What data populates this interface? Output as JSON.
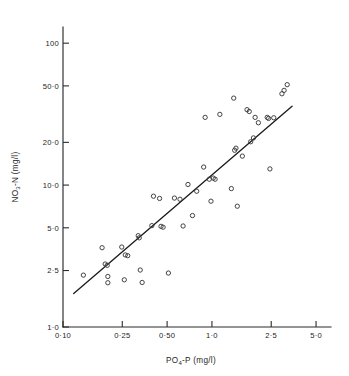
{
  "chart_data": {
    "type": "scatter",
    "title": "",
    "subtitle": "",
    "xlabel": "PO4-P (mg/l)",
    "ylabel": "NO3-N (mg/l)",
    "xlabel_parts": {
      "lead": "PO",
      "sub": "4",
      "tail": "-P (mg/l)"
    },
    "ylabel_parts": {
      "lead": "NO",
      "sub": "3",
      "tail": "-N (mg/l)"
    },
    "xscale": "log",
    "yscale": "log",
    "xlim": [
      0.1,
      6.3
    ],
    "ylim": [
      1.0,
      130
    ],
    "grid": false,
    "legend": null,
    "legend_position": "none",
    "marker_style": "open-circle",
    "xticks": [
      {
        "value": 0.1,
        "label": "0·10"
      },
      {
        "value": 0.25,
        "label": "0·25"
      },
      {
        "value": 0.5,
        "label": "0·50"
      },
      {
        "value": 1.0,
        "label": "1·0"
      },
      {
        "value": 2.5,
        "label": "2·5"
      },
      {
        "value": 5.0,
        "label": "5·0"
      }
    ],
    "yticks": [
      {
        "value": 1.0,
        "label": "1·0"
      },
      {
        "value": 2.5,
        "label": "2·5"
      },
      {
        "value": 5.0,
        "label": "5·0"
      },
      {
        "value": 10.0,
        "label": "10·0"
      },
      {
        "value": 20.0,
        "label": "20·0"
      },
      {
        "value": 50.0,
        "label": "50·0"
      },
      {
        "value": 100.0,
        "label": "100"
      }
    ],
    "series": [
      {
        "name": "samples",
        "marker": "open-circle",
        "points": [
          [
            0.137,
            2.32
          ],
          [
            0.183,
            3.62
          ],
          [
            0.192,
            2.78
          ],
          [
            0.198,
            2.72
          ],
          [
            0.2,
            2.27
          ],
          [
            0.2,
            2.05
          ],
          [
            0.248,
            3.66
          ],
          [
            0.258,
            2.15
          ],
          [
            0.262,
            3.22
          ],
          [
            0.272,
            3.18
          ],
          [
            0.32,
            4.4
          ],
          [
            0.325,
            4.25
          ],
          [
            0.33,
            2.52
          ],
          [
            0.34,
            2.06
          ],
          [
            0.395,
            5.18
          ],
          [
            0.405,
            8.35
          ],
          [
            0.445,
            8.05
          ],
          [
            0.455,
            5.12
          ],
          [
            0.47,
            5.05
          ],
          [
            0.51,
            2.4
          ],
          [
            0.56,
            8.1
          ],
          [
            0.61,
            7.95
          ],
          [
            0.64,
            5.15
          ],
          [
            0.69,
            10.1
          ],
          [
            0.74,
            6.1
          ],
          [
            0.79,
            9.05
          ],
          [
            0.88,
            13.4
          ],
          [
            0.9,
            30.0
          ],
          [
            0.96,
            11.0
          ],
          [
            0.985,
            7.7
          ],
          [
            1.02,
            11.2
          ],
          [
            1.05,
            11.0
          ],
          [
            1.13,
            31.5
          ],
          [
            1.35,
            9.45
          ],
          [
            1.4,
            41.0
          ],
          [
            1.42,
            17.6
          ],
          [
            1.45,
            18.2
          ],
          [
            1.48,
            7.1
          ],
          [
            1.6,
            16.0
          ],
          [
            1.72,
            34.0
          ],
          [
            1.78,
            33.0
          ],
          [
            1.82,
            20.2
          ],
          [
            1.9,
            21.5
          ],
          [
            1.95,
            30.0
          ],
          [
            2.05,
            27.5
          ],
          [
            2.35,
            30.0
          ],
          [
            2.4,
            29.5
          ],
          [
            2.45,
            13.0
          ],
          [
            2.6,
            29.8
          ],
          [
            2.95,
            44.0
          ],
          [
            3.05,
            46.5
          ],
          [
            3.2,
            51.0
          ]
        ]
      }
    ],
    "fit_line": {
      "name": "regression line",
      "x_start": 0.118,
      "y_start": 1.72,
      "x_end": 3.45,
      "y_end": 36.0
    },
    "n_points": 52
  }
}
